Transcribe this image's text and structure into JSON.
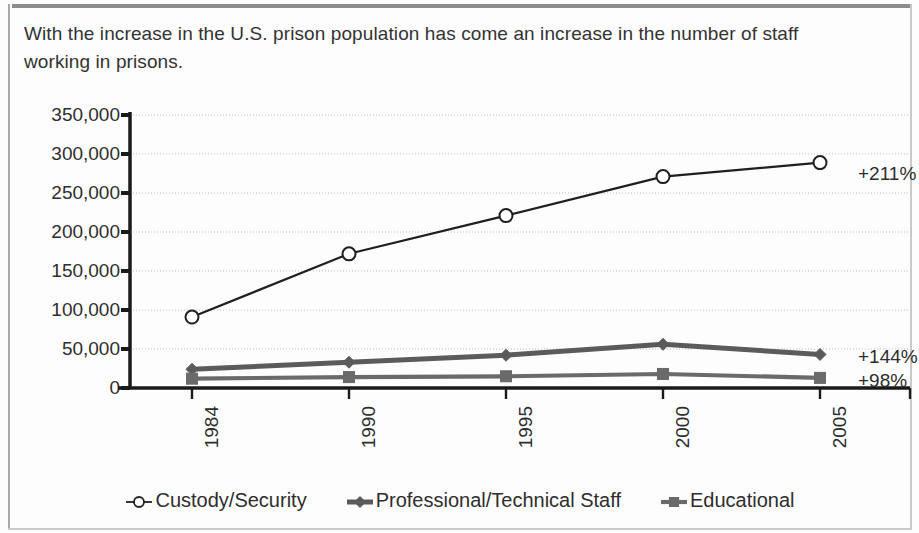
{
  "caption": "With the increase in the U.S. prison population has come an increase in the number of staff working in prisons.",
  "colors": {
    "series_custody": "#1f1f1f",
    "series_professional": "#5b5b5b",
    "series_educational": "#6a6a6a",
    "axis": "#1a1a1a",
    "gridline": "#d3d3d3",
    "text": "#2e2e2e",
    "rule": "#8d8d8d"
  },
  "chart_data": {
    "type": "line",
    "title": "",
    "xlabel": "",
    "ylabel": "",
    "categories": [
      "1984",
      "1990",
      "1995",
      "2000",
      "2005"
    ],
    "ylim": [
      0,
      350000
    ],
    "ytick_labels": [
      "350,000",
      "300,000",
      "250,000",
      "200,000",
      "150,000",
      "100,000",
      "50,000",
      "0"
    ],
    "ytick_values": [
      350000,
      300000,
      250000,
      200000,
      150000,
      100000,
      50000,
      0
    ],
    "grid": true,
    "legend_position": "bottom",
    "series": [
      {
        "name": "Custody/Security",
        "marker": "open-circle",
        "values": [
          91000,
          172000,
          221000,
          271000,
          289000
        ],
        "end_annotation": "+211%"
      },
      {
        "name": "Professional/Technical Staff",
        "marker": "diamond",
        "values": [
          24000,
          33000,
          42000,
          56000,
          43000
        ],
        "end_annotation": "+144%"
      },
      {
        "name": "Educational",
        "marker": "square",
        "values": [
          12000,
          14000,
          15000,
          18000,
          13000
        ],
        "end_annotation": "+98%"
      }
    ]
  },
  "legend": [
    {
      "label": "Custody/Security",
      "marker": "open-circle"
    },
    {
      "label": "Professional/Technical Staff",
      "marker": "diamond"
    },
    {
      "label": "Educational",
      "marker": "square"
    }
  ],
  "annotations": [
    {
      "text": "+211%",
      "series": "Custody/Security"
    },
    {
      "text": "+144%",
      "series": "Professional/Technical Staff"
    },
    {
      "text": "+98%",
      "series": "Educational"
    }
  ]
}
